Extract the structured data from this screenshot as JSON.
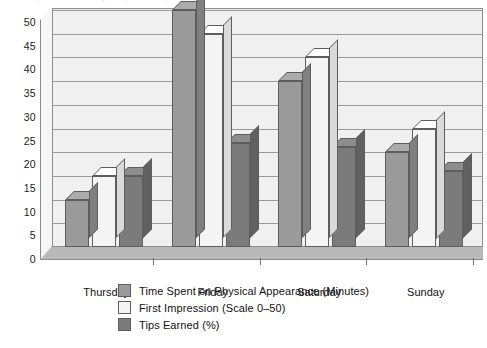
{
  "caption_remnant": "to assess, and that are the top , but , that it was , that is",
  "chart_data": {
    "type": "bar",
    "title": "",
    "subtitle": "",
    "xlabel": "",
    "ylabel": "",
    "categories": [
      "Thursday",
      "Friday",
      "Saturday",
      "Sunday"
    ],
    "series": [
      {
        "name": "Time Spent on Physical Appearance (Minutes)",
        "color": "#9a9a9a",
        "values": [
          10,
          50,
          35,
          20
        ]
      },
      {
        "name": "First Impression (Scale 0–50)",
        "color": "#f4f4f4",
        "values": [
          15,
          45,
          40,
          25
        ]
      },
      {
        "name": "Tips Earned (%)",
        "color": "#7b7b7b",
        "values": [
          15,
          22,
          21,
          16
        ]
      }
    ],
    "ylim": [
      0,
      50
    ],
    "ytick_step": 5,
    "yticks": [
      "0",
      "5",
      "10",
      "15",
      "20",
      "25",
      "30",
      "35",
      "40",
      "45",
      "50"
    ],
    "grid": true,
    "legend_position": "bottom-left",
    "style": "3d-column",
    "plot_background": "#f0f0f0",
    "axis_color": "#8c8c8c",
    "gridline_color": "#9a9a9a"
  }
}
